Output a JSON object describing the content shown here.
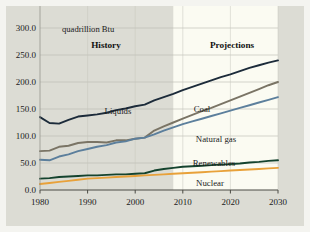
{
  "figure": {
    "unit_label": "quadrillion Btu",
    "background_color": "#dcdcd4",
    "border_color": "#f4f4f0",
    "projection_band_color": "#fbfbf2"
  },
  "periods": {
    "history_label": "History",
    "projections_label": "Projections",
    "split_year": 2008
  },
  "chart_data": {
    "type": "line",
    "title": "",
    "subtitle": "",
    "xlabel": "",
    "ylabel": "quadrillion Btu",
    "xlim": [
      1980,
      2030
    ],
    "ylim": [
      0.0,
      300.0
    ],
    "xticks": [
      1980,
      1990,
      2000,
      2010,
      2020,
      2030
    ],
    "xtick_labels": [
      "1980",
      "1990",
      "2000",
      "2010",
      "2020",
      "2030"
    ],
    "yticks": [
      0.0,
      50.0,
      100.0,
      150.0,
      200.0,
      250.0,
      300.0
    ],
    "ytick_labels": [
      "0.0",
      "50.0",
      "100.0",
      "150.0",
      "200.0",
      "250.0",
      "300.0"
    ],
    "grid": true,
    "legend_position": "inline-annotations",
    "x": [
      1980,
      1982,
      1984,
      1986,
      1988,
      1990,
      1992,
      1994,
      1996,
      1998,
      2000,
      2002,
      2004,
      2006,
      2008,
      2010,
      2012,
      2014,
      2016,
      2018,
      2020,
      2022,
      2024,
      2026,
      2028,
      2030
    ],
    "series": [
      {
        "name": "Liquids",
        "color": "#1c2b3a",
        "values": [
          135,
          124,
          123,
          130,
          136,
          138,
          140,
          143,
          148,
          151,
          155,
          158,
          166,
          172,
          178,
          185,
          191,
          197,
          203,
          209,
          214,
          220,
          226,
          231,
          236,
          240
        ]
      },
      {
        "name": "Coal",
        "color": "#7a7465",
        "values": [
          72,
          73,
          80,
          82,
          87,
          89,
          89,
          88,
          92,
          92,
          95,
          97,
          110,
          118,
          125,
          132,
          139,
          146,
          152,
          159,
          166,
          173,
          180,
          187,
          194,
          200
        ]
      },
      {
        "name": "Natural gas",
        "color": "#5c7f9c",
        "values": [
          56,
          55,
          62,
          66,
          72,
          76,
          80,
          83,
          88,
          90,
          95,
          97,
          103,
          110,
          116,
          122,
          127,
          132,
          137,
          142,
          147,
          152,
          157,
          162,
          167,
          172
        ]
      },
      {
        "name": "Renewables",
        "color": "#14432e",
        "values": [
          21,
          22,
          24,
          25,
          26,
          27,
          27,
          28,
          29,
          29,
          30,
          31,
          36,
          39,
          41,
          43,
          44,
          45,
          46,
          47,
          48,
          49,
          51,
          52,
          54,
          55
        ]
      },
      {
        "name": "Nuclear",
        "color": "#e8a13a",
        "values": [
          11,
          13,
          15,
          17,
          19,
          21,
          22,
          23,
          24,
          25,
          26,
          27,
          28,
          29,
          30,
          31,
          32,
          33,
          34,
          35,
          36,
          37,
          38,
          39,
          40,
          41
        ]
      }
    ]
  }
}
